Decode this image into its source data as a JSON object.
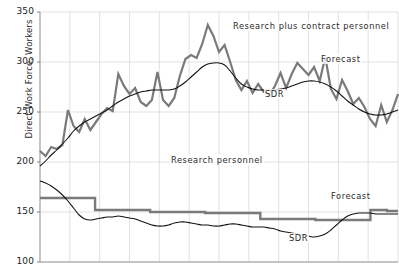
{
  "chart_data": {
    "type": "line",
    "title": "",
    "xlabel": "",
    "ylabel": "Direct Work Force, Workers",
    "ylim": [
      100,
      350
    ],
    "yticks": [
      100,
      150,
      200,
      250,
      300,
      350
    ],
    "ytick_labels": [
      "100",
      "150",
      "200",
      "250",
      "300",
      "350"
    ],
    "xlim": [
      0,
      12
    ],
    "xticks": [
      0,
      1,
      2,
      3,
      4,
      5,
      6,
      7,
      8,
      9,
      10,
      11,
      12
    ],
    "xtick_labels": [
      "",
      "",
      "",
      "",
      "",
      "",
      "",
      "",
      "",
      "",
      "",
      "",
      ""
    ],
    "grid": true,
    "legend": "none (inline annotations)",
    "annotations": [
      {
        "text": "Research plus contract personnel",
        "x": 232,
        "y": 21
      },
      {
        "text": "Forecast",
        "x": 320,
        "y": 54
      },
      {
        "text": "SDR",
        "x": 264,
        "y": 89
      },
      {
        "text": "Research personnel",
        "x": 170,
        "y": 155
      },
      {
        "text": "Forecast",
        "x": 330,
        "y": 191
      },
      {
        "text": "SDR",
        "x": 288,
        "y": 233
      }
    ],
    "series": [
      {
        "name": "Research plus contract personnel",
        "style": "thick-gray-jagged",
        "color": "#7a7a7a",
        "values": [
          211,
          206,
          215,
          213,
          217,
          252,
          236,
          230,
          243,
          232,
          240,
          248,
          254,
          251,
          288,
          276,
          268,
          274,
          260,
          256,
          262,
          290,
          262,
          256,
          264,
          286,
          303,
          307,
          304,
          318,
          337,
          326,
          310,
          317,
          300,
          282,
          272,
          281,
          269,
          278,
          270,
          267,
          276,
          289,
          274,
          288,
          299,
          293,
          287,
          295,
          281,
          305,
          273,
          263,
          282,
          271,
          258,
          264,
          255,
          243,
          236,
          257,
          240,
          252,
          268
        ]
      },
      {
        "name": "SDR (research plus contract)",
        "style": "thin-black-smooth",
        "color": "#111111",
        "values": [
          196,
          201,
          207,
          212,
          218,
          224,
          231,
          236,
          240,
          243,
          246,
          249,
          252,
          256,
          260,
          263,
          266,
          268,
          270,
          271,
          272,
          272,
          272,
          272,
          273,
          276,
          280,
          285,
          290,
          295,
          298,
          299,
          299,
          297,
          291,
          284,
          278,
          275,
          273,
          272,
          272,
          272,
          272,
          273,
          274,
          276,
          278,
          280,
          281,
          281,
          280,
          278,
          275,
          271,
          266,
          261,
          257,
          253,
          250,
          248,
          247,
          247,
          248,
          250,
          252
        ]
      },
      {
        "name": "Research personnel",
        "style": "thick-gray-step",
        "color": "#7a7a7a",
        "values": [
          164,
          164,
          164,
          164,
          164,
          164,
          164,
          164,
          164,
          164,
          152,
          152,
          152,
          152,
          152,
          152,
          152,
          152,
          152,
          152,
          150,
          150,
          150,
          150,
          150,
          150,
          150,
          150,
          150,
          150,
          149,
          149,
          149,
          149,
          149,
          149,
          149,
          149,
          149,
          149,
          143,
          143,
          143,
          143,
          143,
          143,
          143,
          143,
          143,
          143,
          142,
          142,
          142,
          142,
          142,
          142,
          142,
          142,
          142,
          142,
          152,
          152,
          152,
          151,
          151
        ]
      },
      {
        "name": "SDR (research personnel)",
        "style": "thin-black-smooth",
        "color": "#111111",
        "values": [
          181,
          179,
          176,
          172,
          167,
          161,
          154,
          147,
          143,
          142,
          143,
          144,
          145,
          145,
          146,
          145,
          144,
          143,
          141,
          139,
          137,
          136,
          136,
          137,
          139,
          140,
          140,
          139,
          138,
          137,
          137,
          136,
          136,
          137,
          138,
          138,
          137,
          136,
          135,
          135,
          135,
          134,
          133,
          131,
          130,
          129,
          128,
          127,
          126,
          125,
          126,
          128,
          132,
          137,
          142,
          146,
          148,
          149,
          149,
          149,
          148,
          148,
          148,
          148,
          148
        ]
      }
    ]
  },
  "axis": {
    "y_title": "Direct Work Force, Workers"
  }
}
